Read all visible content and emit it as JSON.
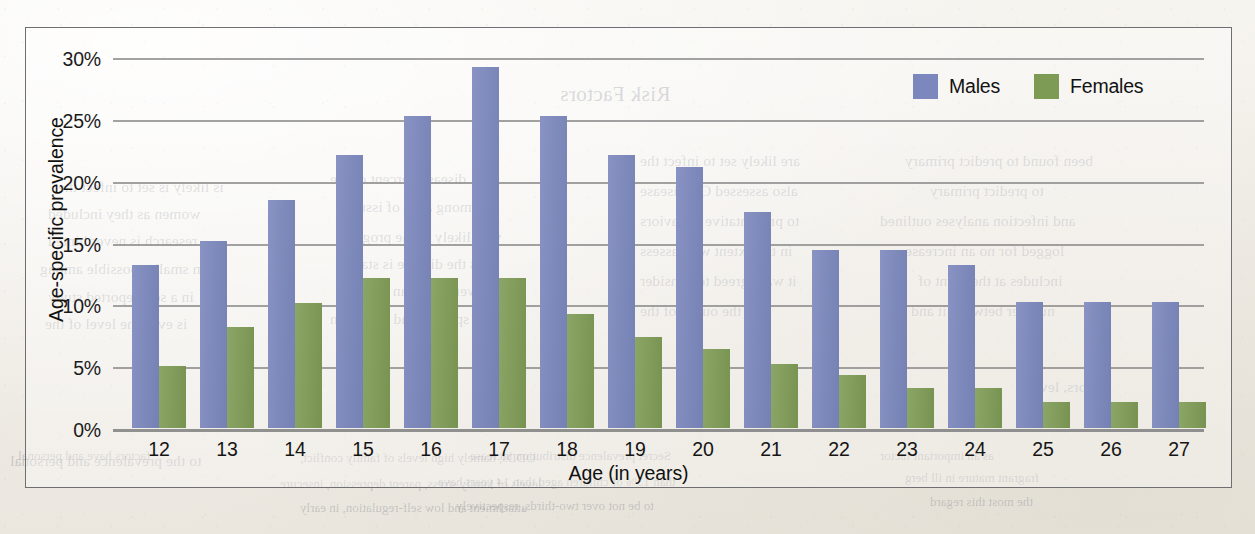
{
  "page": {
    "background_color": "#f3f1ec",
    "border_color": "#6f6f73"
  },
  "chart_data": {
    "type": "bar",
    "title": "",
    "xlabel": "Age (in years)",
    "ylabel": "Age-specific prevalence",
    "categories": [
      "12",
      "13",
      "14",
      "15",
      "16",
      "17",
      "18",
      "19",
      "20",
      "21",
      "22",
      "23",
      "24",
      "25",
      "26",
      "27"
    ],
    "series": [
      {
        "name": "Males",
        "color": "#7b87bd",
        "values": [
          13.2,
          15.1,
          18.4,
          22.1,
          25.2,
          29.2,
          25.2,
          22.1,
          21.1,
          17.5,
          14.4,
          14.4,
          13.2,
          10.2,
          10.2,
          10.2
        ]
      },
      {
        "name": "Females",
        "color": "#7e9b55",
        "values": [
          5.0,
          8.2,
          10.1,
          12.1,
          12.1,
          12.1,
          9.2,
          7.4,
          6.4,
          5.2,
          4.3,
          3.2,
          3.2,
          2.1,
          2.1,
          2.1
        ]
      }
    ],
    "ylim": [
      0,
      30
    ],
    "yticks": [
      "0%",
      "5%",
      "10%",
      "15%",
      "20%",
      "25%",
      "30%"
    ],
    "ytick_values": [
      0,
      5,
      10,
      15,
      20,
      25,
      30
    ],
    "grid": true,
    "legend_position": "top-right",
    "value_suffix": "%"
  },
  "legend": {
    "items": [
      {
        "label": "Males"
      },
      {
        "label": "Females"
      }
    ]
  },
  "bleed_text": {
    "lines": [
      {
        "text": "Risk Factors",
        "x": 560,
        "y": 82,
        "style": "b-head"
      },
      {
        "text": "is likely is set to infect the",
        "x": 58,
        "y": 178,
        "style": "b-body"
      },
      {
        "text": "disease percent of the",
        "x": 330,
        "y": 170,
        "style": "b-body"
      },
      {
        "text": "are likely set to infect the",
        "x": 640,
        "y": 152,
        "style": "b-body"
      },
      {
        "text": "been found to predict primary",
        "x": 905,
        "y": 152,
        "style": "b-body"
      },
      {
        "text": "women as they included",
        "x": 48,
        "y": 205,
        "style": "b-body"
      },
      {
        "text": "among a set of issues",
        "x": 345,
        "y": 198,
        "style": "b-body"
      },
      {
        "text": "also assessed CD disease",
        "x": 640,
        "y": 182,
        "style": "b-body"
      },
      {
        "text": "to predict primary",
        "x": 930,
        "y": 182,
        "style": "b-body"
      },
      {
        "text": "research is never hinted",
        "x": 48,
        "y": 232,
        "style": "b-body"
      },
      {
        "text": "who likely in the progress",
        "x": 338,
        "y": 228,
        "style": "b-body"
      },
      {
        "text": "to preventative behaviors",
        "x": 640,
        "y": 212,
        "style": "b-body"
      },
      {
        "text": "and infection analyses outlined",
        "x": 880,
        "y": 212,
        "style": "b-body"
      },
      {
        "text": "even smaller possible among",
        "x": 40,
        "y": 260,
        "style": "b-body"
      },
      {
        "text": "as the disease is stated",
        "x": 342,
        "y": 255,
        "style": "b-body"
      },
      {
        "text": "in the extent with assess",
        "x": 640,
        "y": 242,
        "style": "b-body"
      },
      {
        "text": "logged for no an increase",
        "x": 905,
        "y": 242,
        "style": "b-body"
      },
      {
        "text": "in a self-reported study",
        "x": 48,
        "y": 288,
        "style": "b-body"
      },
      {
        "text": "were same an analysis",
        "x": 338,
        "y": 282,
        "style": "b-body"
      },
      {
        "text": "it was agreed to consider",
        "x": 640,
        "y": 272,
        "style": "b-body"
      },
      {
        "text": "includes at the point of",
        "x": 918,
        "y": 272,
        "style": "b-body"
      },
      {
        "text": "is even the level of the",
        "x": 45,
        "y": 315,
        "style": "b-body"
      },
      {
        "text": "most specific and condition",
        "x": 330,
        "y": 310,
        "style": "b-body"
      },
      {
        "text": "was the outset of the",
        "x": 640,
        "y": 302,
        "style": "b-body"
      },
      {
        "text": "number between it and a",
        "x": 900,
        "y": 302,
        "style": "b-body"
      },
      {
        "text": "factors, lev",
        "x": 1040,
        "y": 378,
        "style": "b-body"
      },
      {
        "text": "level",
        "x": 1108,
        "y": 405,
        "style": "b-body"
      },
      {
        "text": "to the prevalence and personal",
        "x": 10,
        "y": 452,
        "style": "b-body"
      },
      {
        "text": "factors have and personal",
        "x": 18,
        "y": 448,
        "style": "b-small"
      },
      {
        "text": "ODDs, namely high levels of family conflict,",
        "x": 300,
        "y": 450,
        "style": "b-small"
      },
      {
        "text": "levels of family stress, parent depression, insecure",
        "x": 280,
        "y": 476,
        "style": "b-small"
      },
      {
        "text": "attachment and low self-regulation, in early",
        "x": 300,
        "y": 500,
        "style": "b-small"
      },
      {
        "text": "Secret prevalence distribution increase",
        "x": 470,
        "y": 448,
        "style": "b-small"
      },
      {
        "text": "than 13% of children aged than 14 years have",
        "x": 438,
        "y": 474,
        "style": "b-small"
      },
      {
        "text": "to be not over two-thirds, respectively",
        "x": 456,
        "y": 498,
        "style": "b-small"
      },
      {
        "text": "as an important factor",
        "x": 880,
        "y": 448,
        "style": "b-small"
      },
      {
        "text": "fragrant mature in ill berg",
        "x": 905,
        "y": 470,
        "style": "b-small"
      },
      {
        "text": "the most this regard",
        "x": 930,
        "y": 494,
        "style": "b-small"
      }
    ]
  }
}
